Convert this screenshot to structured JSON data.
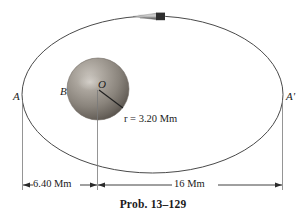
{
  "figure": {
    "caption": "Prob. 13–129",
    "type": "orbital-mechanics-diagram",
    "background_color": "#ffffff",
    "line_color": "#3a3a3a"
  },
  "orbit": {
    "name": "elliptical-orbit-path",
    "cx": 152.5,
    "cy": 94.5,
    "rx": 130.5,
    "ry": 78.5,
    "stroke": "#4a4a4a"
  },
  "planet": {
    "name": "planet-sphere",
    "cx": 98,
    "cy": 89,
    "r": 31,
    "center_label": "O",
    "surface_label": "B",
    "fill_light": "#b9b4ae",
    "fill_mid": "#8e8880",
    "fill_dark": "#565049"
  },
  "satellite": {
    "name": "spacecraft",
    "x": 149,
    "y": 16,
    "length": 32,
    "height": 7,
    "body_color": "#7d7d7d",
    "nose_color": "#2e2e2e"
  },
  "apses": {
    "left_label": "A",
    "right_label": "A'"
  },
  "radius_callout": {
    "symbol": "r",
    "equals": " = ",
    "value": "3.20 Mm",
    "full_text": "r = 3.20 Mm"
  },
  "dimensions": [
    {
      "name": "perigee-distance",
      "label": "6.40 Mm",
      "x_start": 22,
      "x_end": 97,
      "y": 185
    },
    {
      "name": "apogee-distance",
      "label": "16 Mm",
      "x_start": 97,
      "x_end": 282,
      "y": 185
    }
  ]
}
